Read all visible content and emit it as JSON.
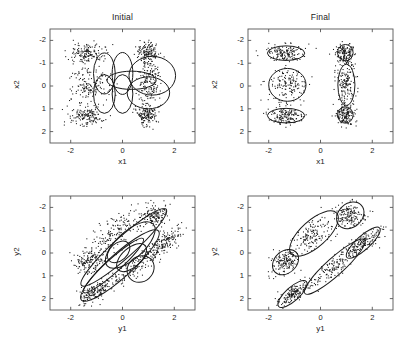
{
  "figure": {
    "background": "#ffffff",
    "ink": "#1a1a1a",
    "width": 413,
    "height": 346
  },
  "panels": [
    {
      "key": "top_left",
      "title": "Initial",
      "xlabel": "x1",
      "ylabel": "x2",
      "xticks": [
        "-2",
        "0",
        "2"
      ],
      "yticks": [
        "2",
        "1",
        "0",
        "-1",
        "-2"
      ]
    },
    {
      "key": "top_right",
      "title": "Final",
      "xlabel": "x1",
      "ylabel": "x2",
      "xticks": [
        "-2",
        "0",
        "2"
      ],
      "yticks": [
        "2",
        "1",
        "0",
        "-1",
        "-2"
      ]
    },
    {
      "key": "bottom_left",
      "title": "",
      "xlabel": "y1",
      "ylabel": "y2",
      "xticks": [
        "-2",
        "0",
        "2"
      ],
      "yticks": [
        "2",
        "1",
        "0",
        "-1",
        "-2"
      ]
    },
    {
      "key": "bottom_right",
      "title": "",
      "xlabel": "y1",
      "ylabel": "y2",
      "xticks": [
        "-2",
        "0",
        "2"
      ],
      "yticks": [
        "2",
        "1",
        "0",
        "-1",
        "-2"
      ]
    }
  ],
  "chart_data": [
    {
      "type": "scatter",
      "panel": "top_left",
      "title": "Initial",
      "xlabel": "x1",
      "ylabel": "x2",
      "xlim": [
        -2.8,
        2.8
      ],
      "ylim": [
        -2.5,
        2.5
      ],
      "xticks": [
        -2,
        0,
        2
      ],
      "yticks": [
        -2,
        -1,
        0,
        1,
        2
      ],
      "grid": false,
      "legend": null,
      "annotation": "Initial mixture-of-Gaussians contours over x-space data; six broad overlapping components covering the central band.",
      "point_count": 900,
      "data_clusters": [
        {
          "cx": -1.35,
          "cy": 1.45,
          "sx": 0.34,
          "sy": 0.22,
          "rot": 0,
          "n": 150
        },
        {
          "cx": -1.3,
          "cy": 0.05,
          "sx": 0.38,
          "sy": 0.36,
          "rot": 0,
          "n": 150
        },
        {
          "cx": -1.35,
          "cy": -1.3,
          "sx": 0.34,
          "sy": 0.22,
          "rot": 0,
          "n": 150
        },
        {
          "cx": 0.95,
          "cy": 1.45,
          "sx": 0.2,
          "sy": 0.24,
          "rot": 0,
          "n": 150
        },
        {
          "cx": 1.05,
          "cy": 0.05,
          "sx": 0.22,
          "sy": 0.5,
          "rot": 0,
          "n": 150
        },
        {
          "cx": 0.95,
          "cy": -1.25,
          "sx": 0.2,
          "sy": 0.24,
          "rot": 0,
          "n": 150
        }
      ],
      "contours": [
        {
          "cx": -0.7,
          "cy": 0.55,
          "rx": 0.42,
          "ry": 0.9,
          "rot": 0
        },
        {
          "cx": -0.7,
          "cy": -0.35,
          "rx": 0.42,
          "ry": 0.85,
          "rot": 0
        },
        {
          "cx": 0.0,
          "cy": 0.55,
          "rx": 0.4,
          "ry": 0.92,
          "rot": 0
        },
        {
          "cx": 0.0,
          "cy": -0.35,
          "rx": 0.4,
          "ry": 0.85,
          "rot": 0
        },
        {
          "cx": 1.15,
          "cy": 0.45,
          "rx": 0.9,
          "ry": 0.85,
          "rot": 0
        },
        {
          "cx": 1.0,
          "cy": -0.3,
          "rx": 0.82,
          "ry": 0.7,
          "rot": 0
        },
        {
          "cx": 0.35,
          "cy": 0.25,
          "rx": 0.95,
          "ry": 0.4,
          "rot": 0
        }
      ]
    },
    {
      "type": "scatter",
      "panel": "top_right",
      "title": "Final",
      "xlabel": "x1",
      "ylabel": "x2",
      "xlim": [
        -2.8,
        2.8
      ],
      "ylim": [
        -2.5,
        2.5
      ],
      "xticks": [
        -2,
        0,
        2
      ],
      "yticks": [
        -2,
        -1,
        0,
        1,
        2
      ],
      "grid": false,
      "legend": null,
      "annotation": "Converged mixture contours tightly fitted around six x-space clusters.",
      "point_count": 900,
      "data_clusters": [
        {
          "cx": -1.35,
          "cy": 1.45,
          "sx": 0.34,
          "sy": 0.2,
          "rot": 0,
          "n": 150
        },
        {
          "cx": -1.3,
          "cy": 0.05,
          "sx": 0.36,
          "sy": 0.34,
          "rot": 0,
          "n": 150
        },
        {
          "cx": -1.35,
          "cy": -1.3,
          "sx": 0.34,
          "sy": 0.2,
          "rot": 0,
          "n": 150
        },
        {
          "cx": 0.95,
          "cy": 1.45,
          "sx": 0.18,
          "sy": 0.22,
          "rot": 0,
          "n": 150
        },
        {
          "cx": 1.0,
          "cy": 0.05,
          "sx": 0.2,
          "sy": 0.48,
          "rot": 0,
          "n": 150
        },
        {
          "cx": 0.95,
          "cy": -1.25,
          "sx": 0.18,
          "sy": 0.22,
          "rot": 0,
          "n": 150
        }
      ],
      "contours": [
        {
          "cx": -1.33,
          "cy": 1.44,
          "rx": 0.72,
          "ry": 0.32,
          "rot": 0
        },
        {
          "cx": -1.28,
          "cy": 0.05,
          "rx": 0.72,
          "ry": 0.72,
          "rot": 0
        },
        {
          "cx": -1.33,
          "cy": -1.3,
          "rx": 0.72,
          "ry": 0.32,
          "rot": 0
        },
        {
          "cx": 0.96,
          "cy": 1.46,
          "rx": 0.3,
          "ry": 0.36,
          "rot": 0
        },
        {
          "cx": 1.0,
          "cy": 0.05,
          "rx": 0.33,
          "ry": 0.9,
          "rot": 0
        },
        {
          "cx": 0.96,
          "cy": -1.27,
          "rx": 0.3,
          "ry": 0.36,
          "rot": 0
        }
      ]
    },
    {
      "type": "scatter",
      "panel": "bottom_left",
      "title": "",
      "xlabel": "y1",
      "ylabel": "y2",
      "xlim": [
        -2.8,
        2.8
      ],
      "ylim": [
        -2.5,
        2.5
      ],
      "xticks": [
        -2,
        0,
        2
      ],
      "yticks": [
        -2,
        -1,
        0,
        1,
        2
      ],
      "grid": false,
      "legend": null,
      "annotation": "Initial mixture contours over y-space data; long diagonal components spanning the elongated data band.",
      "point_count": 900,
      "data_clusters": [
        {
          "cx": -1.1,
          "cy": -1.75,
          "sx": 0.36,
          "sy": 0.16,
          "rot": 42,
          "n": 150
        },
        {
          "cx": -1.25,
          "cy": -0.35,
          "sx": 0.32,
          "sy": 0.26,
          "rot": 42,
          "n": 150
        },
        {
          "cx": -0.3,
          "cy": 0.85,
          "sx": 0.62,
          "sy": 0.3,
          "rot": 42,
          "n": 150
        },
        {
          "cx": 0.55,
          "cy": -0.55,
          "sx": 0.8,
          "sy": 0.2,
          "rot": 42,
          "n": 150
        },
        {
          "cx": 1.2,
          "cy": 1.65,
          "sx": 0.3,
          "sy": 0.28,
          "rot": 42,
          "n": 150
        },
        {
          "cx": 1.6,
          "cy": 0.45,
          "sx": 0.45,
          "sy": 0.16,
          "rot": 42,
          "n": 150
        }
      ],
      "contours": [
        {
          "cx": 0.05,
          "cy": 0.25,
          "rx": 2.2,
          "ry": 0.45,
          "rot": 42
        },
        {
          "cx": -0.1,
          "cy": -0.55,
          "rx": 2.0,
          "ry": 0.52,
          "rot": 42
        },
        {
          "cx": 0.3,
          "cy": 0.35,
          "rx": 1.2,
          "ry": 0.6,
          "rot": 42
        },
        {
          "cx": 0.35,
          "cy": -0.2,
          "rx": 0.7,
          "ry": 0.42,
          "rot": 42
        },
        {
          "cx": 0.7,
          "cy": -0.7,
          "rx": 0.55,
          "ry": 0.55,
          "rot": 42
        },
        {
          "cx": -0.15,
          "cy": 0.05,
          "rx": 0.5,
          "ry": 0.38,
          "rot": 42
        },
        {
          "cx": -0.35,
          "cy": -0.55,
          "rx": 1.55,
          "ry": 0.3,
          "rot": 42
        }
      ]
    },
    {
      "type": "scatter",
      "panel": "bottom_right",
      "title": "",
      "xlabel": "y1",
      "ylabel": "y2",
      "xlim": [
        -2.8,
        2.8
      ],
      "ylim": [
        -2.5,
        2.5
      ],
      "xticks": [
        -2,
        0,
        2
      ],
      "yticks": [
        -2,
        -1,
        0,
        1,
        2
      ],
      "grid": false,
      "legend": null,
      "annotation": "Converged mixture contours tightly fitted around six diagonal y-space clusters.",
      "point_count": 900,
      "data_clusters": [
        {
          "cx": -1.1,
          "cy": -1.8,
          "sx": 0.34,
          "sy": 0.14,
          "rot": 42,
          "n": 150
        },
        {
          "cx": -1.35,
          "cy": -0.4,
          "sx": 0.28,
          "sy": 0.24,
          "rot": 42,
          "n": 150
        },
        {
          "cx": -0.25,
          "cy": 0.85,
          "sx": 0.58,
          "sy": 0.28,
          "rot": 42,
          "n": 150
        },
        {
          "cx": 0.55,
          "cy": -0.6,
          "sx": 0.78,
          "sy": 0.18,
          "rot": 42,
          "n": 150
        },
        {
          "cx": 1.15,
          "cy": 1.65,
          "sx": 0.28,
          "sy": 0.26,
          "rot": 42,
          "n": 150
        },
        {
          "cx": 1.65,
          "cy": 0.45,
          "sx": 0.42,
          "sy": 0.15,
          "rot": 42,
          "n": 150
        }
      ],
      "contours": [
        {
          "cx": -1.08,
          "cy": -1.8,
          "rx": 0.72,
          "ry": 0.3,
          "rot": 42
        },
        {
          "cx": -1.35,
          "cy": -0.4,
          "rx": 0.56,
          "ry": 0.48,
          "rot": 42
        },
        {
          "cx": -0.25,
          "cy": 0.85,
          "rx": 1.18,
          "ry": 0.58,
          "rot": 42
        },
        {
          "cx": 0.55,
          "cy": -0.6,
          "rx": 1.55,
          "ry": 0.38,
          "rot": 42
        },
        {
          "cx": 1.15,
          "cy": 1.65,
          "rx": 0.58,
          "ry": 0.52,
          "rot": 42
        },
        {
          "cx": 1.65,
          "cy": 0.45,
          "rx": 0.85,
          "ry": 0.3,
          "rot": 42
        }
      ]
    }
  ]
}
